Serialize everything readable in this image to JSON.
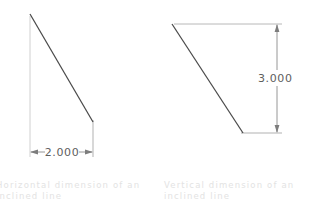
{
  "canvas": {
    "width": 309,
    "height": 213,
    "background": "#ffffff"
  },
  "colors": {
    "object_line": "#4a4a4a",
    "extension_line": "#b9b9b9",
    "dimension_line": "#8a8a8a",
    "dimension_text": "#5e5e5e",
    "caption_text": "#e3e3e3"
  },
  "figures": [
    {
      "id": "horizontal-dimension",
      "dimension_value": "2.000",
      "dimension_orientation": "horizontal",
      "caption": "Horizontal dimension of an inclined line",
      "inclined_line": {
        "x1": 30,
        "y1": 14,
        "x2": 93,
        "y2": 122
      },
      "extension_lines": [
        {
          "x1": 30,
          "y1": 16,
          "x2": 30,
          "y2": 157
        },
        {
          "x1": 93,
          "y1": 120,
          "x2": 93,
          "y2": 157
        }
      ],
      "dimension_line": {
        "x1": 30,
        "y1": 152,
        "x2": 93,
        "y2": 152
      }
    },
    {
      "id": "vertical-dimension",
      "dimension_value": "3.000",
      "dimension_orientation": "vertical",
      "caption": "Vertical dimension of an inclined line",
      "inclined_line": {
        "x1": 172,
        "y1": 24,
        "x2": 243,
        "y2": 133
      },
      "extension_lines": [
        {
          "x1": 174,
          "y1": 24,
          "x2": 282,
          "y2": 24
        },
        {
          "x1": 241,
          "y1": 133,
          "x2": 282,
          "y2": 133
        }
      ],
      "dimension_line": {
        "x1": 277,
        "y1": 24,
        "x2": 277,
        "y2": 133
      }
    }
  ]
}
